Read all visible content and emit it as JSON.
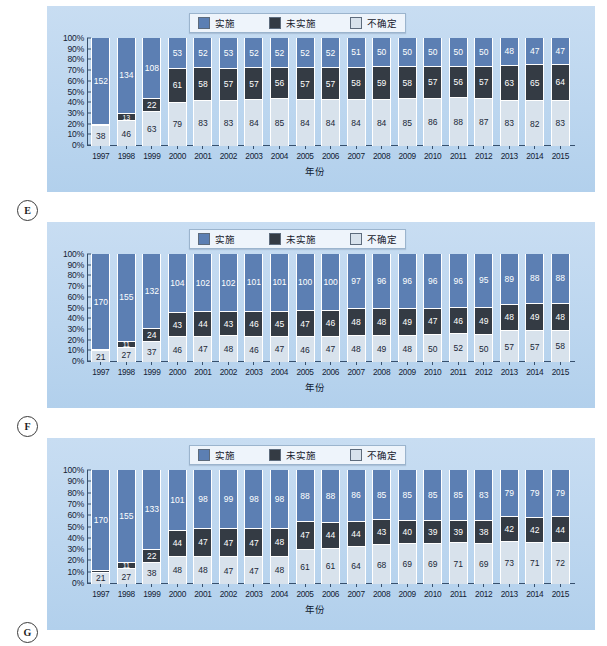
{
  "legend": {
    "items": [
      {
        "label": "实施",
        "color": "#5c7fb3",
        "key": "implemented"
      },
      {
        "label": "未实施",
        "color": "#343b44",
        "key": "not_implemented"
      },
      {
        "label": "不确定",
        "color": "#d8e2ec",
        "key": "uncertain"
      }
    ]
  },
  "axis": {
    "x_title": "年份",
    "y_ticks": [
      "100%",
      "90%",
      "80%",
      "70%",
      "60%",
      "50%",
      "40%",
      "30%",
      "20%",
      "10%",
      "0%"
    ],
    "years": [
      "1997",
      "1998",
      "1999",
      "2000",
      "2001",
      "2002",
      "2003",
      "2004",
      "2005",
      "2006",
      "2007",
      "2008",
      "2009",
      "2010",
      "2011",
      "2012",
      "2013",
      "2014",
      "2015"
    ]
  },
  "panels": [
    {
      "tag": "E"
    },
    {
      "tag": "F"
    },
    {
      "tag": "G"
    }
  ],
  "chart_data": [
    {
      "type": "bar",
      "stacked": true,
      "normalized": true,
      "panel": "E",
      "title": "",
      "xlabel": "年份",
      "ylabel": "",
      "ylim": [
        0,
        100
      ],
      "grid": false,
      "legend_position": "top-center",
      "categories": [
        "1997",
        "1998",
        "1999",
        "2000",
        "2001",
        "2002",
        "2003",
        "2004",
        "2005",
        "2006",
        "2007",
        "2008",
        "2009",
        "2010",
        "2011",
        "2012",
        "2013",
        "2014",
        "2015"
      ],
      "series": [
        {
          "name": "实施",
          "color": "#5c7fb3",
          "values": [
            152,
            134,
            108,
            53,
            52,
            53,
            52,
            52,
            52,
            52,
            51,
            50,
            50,
            50,
            50,
            50,
            48,
            47,
            47
          ]
        },
        {
          "name": "未实施",
          "color": "#343b44",
          "values": [
            2,
            13,
            22,
            61,
            58,
            57,
            57,
            56,
            57,
            57,
            58,
            59,
            58,
            57,
            56,
            57,
            63,
            65,
            64
          ]
        },
        {
          "name": "不确定",
          "color": "#d8e2ec",
          "values": [
            38,
            46,
            63,
            79,
            83,
            83,
            84,
            85,
            84,
            84,
            84,
            84,
            85,
            86,
            88,
            87,
            83,
            82,
            83
          ]
        }
      ]
    },
    {
      "type": "bar",
      "stacked": true,
      "normalized": true,
      "panel": "F",
      "title": "",
      "xlabel": "年份",
      "ylabel": "",
      "ylim": [
        0,
        100
      ],
      "grid": false,
      "legend_position": "top-center",
      "categories": [
        "1997",
        "1998",
        "1999",
        "2000",
        "2001",
        "2002",
        "2003",
        "2004",
        "2005",
        "2006",
        "2007",
        "2008",
        "2009",
        "2010",
        "2011",
        "2012",
        "2013",
        "2014",
        "2015"
      ],
      "series": [
        {
          "name": "实施",
          "color": "#5c7fb3",
          "values": [
            170,
            155,
            132,
            104,
            102,
            102,
            101,
            101,
            100,
            100,
            97,
            96,
            96,
            96,
            96,
            95,
            89,
            88,
            88
          ]
        },
        {
          "name": "未实施",
          "color": "#343b44",
          "values": [
            2,
            11,
            24,
            43,
            44,
            43,
            46,
            45,
            47,
            46,
            48,
            48,
            49,
            47,
            46,
            49,
            48,
            49,
            48
          ]
        },
        {
          "name": "不确定",
          "color": "#d8e2ec",
          "values": [
            21,
            27,
            37,
            46,
            47,
            48,
            46,
            47,
            46,
            47,
            48,
            49,
            48,
            50,
            52,
            50,
            57,
            57,
            58
          ]
        }
      ]
    },
    {
      "type": "bar",
      "stacked": true,
      "normalized": true,
      "panel": "G",
      "title": "",
      "xlabel": "年份",
      "ylabel": "",
      "ylim": [
        0,
        100
      ],
      "grid": false,
      "legend_position": "top-center",
      "categories": [
        "1997",
        "1998",
        "1999",
        "2000",
        "2001",
        "2002",
        "2003",
        "2004",
        "2005",
        "2006",
        "2007",
        "2008",
        "2009",
        "2010",
        "2011",
        "2012",
        "2013",
        "2014",
        "2015"
      ],
      "series": [
        {
          "name": "实施",
          "color": "#5c7fb3",
          "values": [
            170,
            155,
            133,
            101,
            98,
            99,
            98,
            98,
            88,
            88,
            86,
            85,
            85,
            85,
            85,
            83,
            79,
            79,
            79
          ]
        },
        {
          "name": "未实施",
          "color": "#343b44",
          "values": [
            2,
            11,
            22,
            44,
            47,
            47,
            47,
            48,
            47,
            44,
            44,
            43,
            40,
            39,
            39,
            38,
            42,
            42,
            44,
            43
          ]
        },
        {
          "name": "不确定",
          "color": "#d8e2ec",
          "values": [
            21,
            27,
            38,
            48,
            48,
            47,
            47,
            48,
            61,
            61,
            64,
            68,
            69,
            69,
            71,
            69,
            73,
            71,
            72
          ]
        }
      ]
    }
  ]
}
